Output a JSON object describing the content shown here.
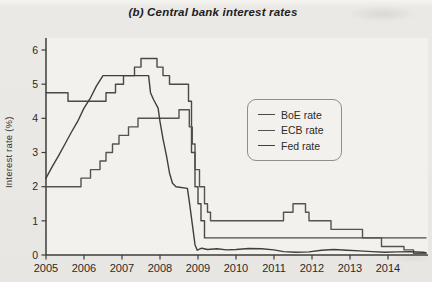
{
  "figure": {
    "title": "(b) Central bank interest rates",
    "ylabel": "Interest rate (%)"
  },
  "chart_data": {
    "type": "line",
    "title": "(b) Central bank interest rates",
    "xlabel": "",
    "ylabel": "Interest rate (%)",
    "xlim": [
      2005,
      2015
    ],
    "ylim": [
      0,
      6
    ],
    "x_ticks": [
      2005,
      2006,
      2007,
      2008,
      2009,
      2010,
      2011,
      2012,
      2013,
      2014
    ],
    "y_ticks": [
      0,
      1,
      2,
      3,
      4,
      5,
      6
    ],
    "grid": false,
    "legend_position": "center-right",
    "axis_color": "#3d3c3a",
    "text_color": "#2b2a28",
    "plot_bg": "#f2f1ed",
    "series": [
      {
        "name": "BoE rate",
        "color": "#4a4947",
        "points": [
          [
            2005.0,
            4.75
          ],
          [
            2005.58,
            4.75
          ],
          [
            2005.58,
            4.5
          ],
          [
            2006.58,
            4.5
          ],
          [
            2006.58,
            4.75
          ],
          [
            2006.83,
            4.75
          ],
          [
            2006.83,
            5.0
          ],
          [
            2007.04,
            5.0
          ],
          [
            2007.04,
            5.25
          ],
          [
            2007.33,
            5.25
          ],
          [
            2007.33,
            5.5
          ],
          [
            2007.5,
            5.5
          ],
          [
            2007.5,
            5.75
          ],
          [
            2007.92,
            5.75
          ],
          [
            2007.92,
            5.5
          ],
          [
            2008.08,
            5.5
          ],
          [
            2008.08,
            5.25
          ],
          [
            2008.25,
            5.25
          ],
          [
            2008.25,
            5.0
          ],
          [
            2008.75,
            5.0
          ],
          [
            2008.75,
            4.5
          ],
          [
            2008.83,
            4.5
          ],
          [
            2008.83,
            3.0
          ],
          [
            2008.92,
            3.0
          ],
          [
            2008.92,
            2.0
          ],
          [
            2009.0,
            2.0
          ],
          [
            2009.0,
            1.5
          ],
          [
            2009.08,
            1.5
          ],
          [
            2009.08,
            1.0
          ],
          [
            2009.17,
            1.0
          ],
          [
            2009.17,
            0.5
          ],
          [
            2015.0,
            0.5
          ]
        ]
      },
      {
        "name": "ECB rate",
        "color": "#545350",
        "points": [
          [
            2005.0,
            2.0
          ],
          [
            2005.92,
            2.0
          ],
          [
            2005.92,
            2.25
          ],
          [
            2006.17,
            2.25
          ],
          [
            2006.17,
            2.5
          ],
          [
            2006.42,
            2.5
          ],
          [
            2006.42,
            2.75
          ],
          [
            2006.58,
            2.75
          ],
          [
            2006.58,
            3.0
          ],
          [
            2006.75,
            3.0
          ],
          [
            2006.75,
            3.25
          ],
          [
            2006.92,
            3.25
          ],
          [
            2006.92,
            3.5
          ],
          [
            2007.17,
            3.5
          ],
          [
            2007.17,
            3.75
          ],
          [
            2007.42,
            3.75
          ],
          [
            2007.42,
            4.0
          ],
          [
            2008.5,
            4.0
          ],
          [
            2008.5,
            4.25
          ],
          [
            2008.77,
            4.25
          ],
          [
            2008.77,
            3.75
          ],
          [
            2008.85,
            3.75
          ],
          [
            2008.85,
            3.25
          ],
          [
            2008.92,
            3.25
          ],
          [
            2008.92,
            2.5
          ],
          [
            2009.04,
            2.5
          ],
          [
            2009.04,
            2.0
          ],
          [
            2009.17,
            2.0
          ],
          [
            2009.17,
            1.5
          ],
          [
            2009.25,
            1.5
          ],
          [
            2009.25,
            1.25
          ],
          [
            2009.33,
            1.25
          ],
          [
            2009.33,
            1.0
          ],
          [
            2011.25,
            1.0
          ],
          [
            2011.25,
            1.25
          ],
          [
            2011.5,
            1.25
          ],
          [
            2011.5,
            1.5
          ],
          [
            2011.83,
            1.5
          ],
          [
            2011.83,
            1.25
          ],
          [
            2011.92,
            1.25
          ],
          [
            2011.92,
            1.0
          ],
          [
            2012.5,
            1.0
          ],
          [
            2012.5,
            0.75
          ],
          [
            2013.33,
            0.75
          ],
          [
            2013.33,
            0.5
          ],
          [
            2013.83,
            0.5
          ],
          [
            2013.83,
            0.25
          ],
          [
            2014.42,
            0.25
          ],
          [
            2014.42,
            0.15
          ],
          [
            2014.67,
            0.15
          ],
          [
            2014.67,
            0.05
          ],
          [
            2015.0,
            0.05
          ]
        ]
      },
      {
        "name": "Fed rate",
        "color": "#413f3d",
        "points": [
          [
            2005.0,
            2.25
          ],
          [
            2005.17,
            2.6
          ],
          [
            2005.33,
            2.9
          ],
          [
            2005.5,
            3.25
          ],
          [
            2005.67,
            3.6
          ],
          [
            2005.83,
            3.9
          ],
          [
            2006.0,
            4.3
          ],
          [
            2006.17,
            4.6
          ],
          [
            2006.33,
            4.95
          ],
          [
            2006.5,
            5.25
          ],
          [
            2007.7,
            5.25
          ],
          [
            2007.75,
            4.75
          ],
          [
            2007.83,
            4.55
          ],
          [
            2007.95,
            4.3
          ],
          [
            2008.0,
            3.9
          ],
          [
            2008.08,
            3.4
          ],
          [
            2008.17,
            2.9
          ],
          [
            2008.25,
            2.4
          ],
          [
            2008.33,
            2.1
          ],
          [
            2008.42,
            2.0
          ],
          [
            2008.72,
            1.95
          ],
          [
            2008.78,
            1.5
          ],
          [
            2008.85,
            0.9
          ],
          [
            2008.92,
            0.3
          ],
          [
            2008.98,
            0.14
          ],
          [
            2009.1,
            0.2
          ],
          [
            2009.25,
            0.16
          ],
          [
            2009.5,
            0.18
          ],
          [
            2009.75,
            0.15
          ],
          [
            2010.0,
            0.16
          ],
          [
            2010.33,
            0.19
          ],
          [
            2010.67,
            0.18
          ],
          [
            2011.0,
            0.15
          ],
          [
            2011.25,
            0.1
          ],
          [
            2011.58,
            0.08
          ],
          [
            2011.92,
            0.09
          ],
          [
            2012.25,
            0.14
          ],
          [
            2012.58,
            0.16
          ],
          [
            2012.92,
            0.14
          ],
          [
            2013.25,
            0.12
          ],
          [
            2013.58,
            0.1
          ],
          [
            2013.92,
            0.08
          ],
          [
            2014.25,
            0.09
          ],
          [
            2014.58,
            0.1
          ],
          [
            2014.92,
            0.08
          ],
          [
            2015.0,
            0.07
          ]
        ]
      }
    ]
  }
}
